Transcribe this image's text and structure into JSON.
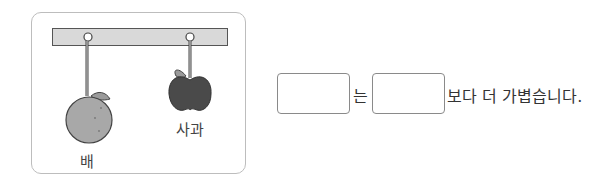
{
  "figure": {
    "items": [
      {
        "name": "pear",
        "label": "배"
      },
      {
        "name": "apple",
        "label": "사과"
      }
    ],
    "colors": {
      "bar": "#d9d9d9",
      "pear": "#a8a8a8",
      "apple": "#4a4a4a",
      "frame": "#bdbdbd"
    }
  },
  "question": {
    "blank1": "",
    "particle": "는",
    "blank2": "",
    "suffix": "보다 더 가볍습니다."
  }
}
